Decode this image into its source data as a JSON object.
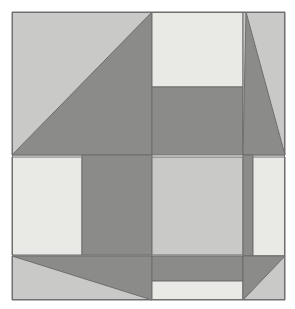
{
  "artwork": {
    "title": "Abstract Geometric Quilt Block",
    "type": "geometric-composition",
    "canvas": {
      "width": 295,
      "height": 309,
      "background": "#ffffff"
    },
    "frame": {
      "x": 12,
      "y": 12,
      "width": 273,
      "height": 288,
      "border_color": "#6f6f6f",
      "border_width": 1
    },
    "palette": {
      "lightest": "#e9e9e6",
      "light": "#c9c9c7",
      "mid": "#c2c2c0",
      "dark": "#8b8b89",
      "outline": "#6f6f6f"
    },
    "grid": {
      "vertical_lines": [
        12,
        82,
        152,
        243,
        253,
        285
      ],
      "horizontal_lines": [
        12,
        87,
        155,
        157,
        255,
        256,
        281,
        300
      ]
    },
    "shapes": [
      {
        "name": "top-left-background",
        "kind": "rect",
        "fill": "light",
        "points": "12,12 152,12 152,155 12,155"
      },
      {
        "name": "top-left-dark-triangle",
        "kind": "triangle",
        "fill": "dark",
        "points": "12,155 152,12 152,155"
      },
      {
        "name": "top-center-lightest-rect",
        "kind": "rect",
        "fill": "lightest",
        "points": "152,12 243,12 243,87 152,87"
      },
      {
        "name": "top-center-dark-rect",
        "kind": "rect",
        "fill": "dark",
        "points": "152,87 243,87 243,155 152,155"
      },
      {
        "name": "top-right-background",
        "kind": "rect",
        "fill": "light",
        "points": "243,12 285,12 285,155 243,155"
      },
      {
        "name": "top-right-dark-triangle",
        "kind": "triangle",
        "fill": "dark",
        "points": "246,12 285,155 243,155"
      },
      {
        "name": "mid-left-lightest-rect",
        "kind": "rect",
        "fill": "lightest",
        "points": "12,157 82,157 82,255 12,255"
      },
      {
        "name": "mid-left-dark-rect",
        "kind": "rect",
        "fill": "dark",
        "points": "82,155 152,155 152,255 82,255"
      },
      {
        "name": "mid-center-light-square",
        "kind": "rect",
        "fill": "light",
        "points": "152,157 243,157 243,255 152,255"
      },
      {
        "name": "mid-right-dark-band",
        "kind": "rect",
        "fill": "dark",
        "points": "243,155 253,155 253,256 243,256"
      },
      {
        "name": "mid-right-lightest-rect",
        "kind": "rect",
        "fill": "lightest",
        "points": "253,157 285,157 285,256 253,256"
      },
      {
        "name": "bottom-left-light-background",
        "kind": "rect",
        "fill": "light",
        "points": "12,256 152,256 152,300 12,300"
      },
      {
        "name": "bottom-left-dark-triangle",
        "kind": "triangle",
        "fill": "dark",
        "points": "12,256 152,256 152,300"
      },
      {
        "name": "bottom-center-dark-band",
        "kind": "rect",
        "fill": "dark",
        "points": "152,256 243,256 243,281 152,281"
      },
      {
        "name": "bottom-center-lightest-rect",
        "kind": "rect",
        "fill": "lightest",
        "points": "152,281 243,281 243,300 152,300"
      },
      {
        "name": "bottom-right-light-background",
        "kind": "rect",
        "fill": "light",
        "points": "243,256 285,256 285,300 243,300"
      },
      {
        "name": "bottom-right-dark-triangle",
        "kind": "triangle",
        "fill": "dark",
        "points": "243,256 285,256 243,300"
      }
    ]
  }
}
